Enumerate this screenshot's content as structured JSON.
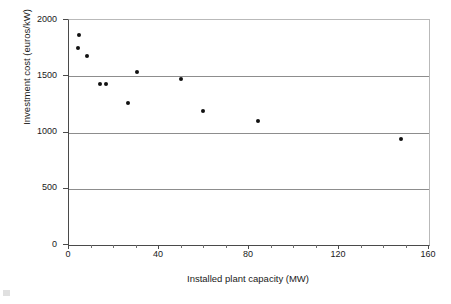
{
  "chart_data": {
    "type": "scatter",
    "title": "",
    "xlabel": "Installed plant capacity (MW)",
    "ylabel": "Investment cost (euros/kW)",
    "xlim": [
      0,
      160
    ],
    "ylim": [
      0,
      2000
    ],
    "xticks": [
      0,
      40,
      80,
      120,
      160
    ],
    "xtick_labels": [
      "0",
      "40",
      "80",
      "120",
      "160"
    ],
    "x_minor_tick_step": 10,
    "yticks": [
      0,
      500,
      1000,
      1500,
      2000
    ],
    "ytick_labels": [
      "0",
      "500",
      "1000",
      "1500",
      "2000"
    ],
    "grid": "horizontal",
    "legend": "none",
    "marker": "filled-diamond",
    "marker_color": "#111111",
    "points": [
      {
        "x": 5.0,
        "y": 1860
      },
      {
        "x": 4.5,
        "y": 1740
      },
      {
        "x": 8.5,
        "y": 1670
      },
      {
        "x": 14.0,
        "y": 1420
      },
      {
        "x": 17.0,
        "y": 1420
      },
      {
        "x": 26.5,
        "y": 1250
      },
      {
        "x": 30.5,
        "y": 1530
      },
      {
        "x": 50.0,
        "y": 1470
      },
      {
        "x": 60.0,
        "y": 1180
      },
      {
        "x": 84.5,
        "y": 1090
      },
      {
        "x": 148.0,
        "y": 930
      }
    ]
  },
  "colors": {
    "axis": "#4a4a4a",
    "gridline": "#8d8d8d",
    "frame_light": "#b9b9b9",
    "marker": "#111111",
    "text": "#1a1a1a",
    "background": "#ffffff"
  }
}
